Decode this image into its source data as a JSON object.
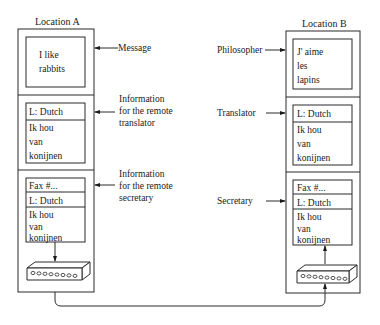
{
  "location_a": {
    "label": "Location A",
    "message_box": {
      "lines": [
        "I like",
        "rabbits"
      ]
    },
    "translator_box": {
      "header": "L: Dutch",
      "lines": [
        "Ik hou",
        "van",
        "konijnen"
      ]
    },
    "secretary_box": {
      "fax_header": "Fax #...",
      "lang_header": "L: Dutch",
      "lines": [
        "Ik hou",
        "van",
        "konijnen"
      ]
    },
    "annotations": [
      {
        "lines": [
          "Message"
        ]
      },
      {
        "lines": [
          "Information",
          "for the remote",
          "translator"
        ]
      },
      {
        "lines": [
          "Information",
          "for the remote",
          "secretary"
        ]
      }
    ]
  },
  "location_b": {
    "label": "Location B",
    "message_box": {
      "lines": [
        "J' aime",
        "les",
        "lapins"
      ]
    },
    "translator_box": {
      "header": "L: Dutch",
      "lines": [
        "Ik hou",
        "van",
        "konijnen"
      ]
    },
    "secretary_box": {
      "fax_header": "Fax #...",
      "lang_header": "L: Dutch",
      "lines": [
        "Ik hou",
        "van",
        "konijnen"
      ]
    },
    "annotations": [
      {
        "lines": [
          "Philosopher"
        ]
      },
      {
        "lines": [
          "Translator"
        ]
      },
      {
        "lines": [
          "Secretary"
        ]
      }
    ]
  },
  "icons": {
    "fax_machine": "fax-machine-icon",
    "arrow": "arrow-icon"
  },
  "colors": {
    "ink": "#1a1a1a",
    "paper": "#ffffff"
  }
}
